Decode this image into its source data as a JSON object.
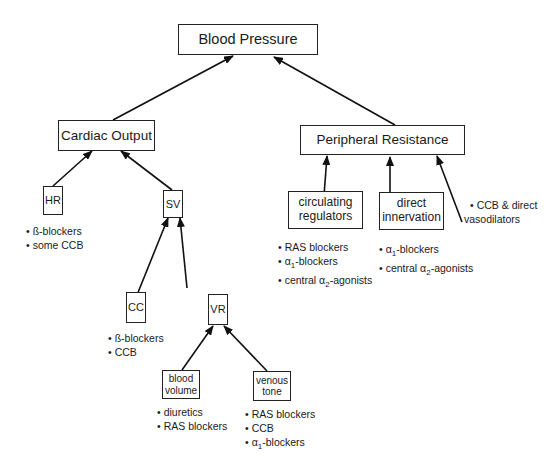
{
  "diagram": {
    "nodes": {
      "blood_pressure": "Blood Pressure",
      "cardiac_output": "Cardiac Output",
      "peripheral_resistance": "Peripheral Resistance",
      "hr": "HR",
      "sv": "SV",
      "cc": "CC",
      "vr": "VR",
      "blood_volume_1": "blood",
      "blood_volume_2": "volume",
      "venous_tone_1": "venous",
      "venous_tone_2": "tone",
      "circulating_1": "circulating",
      "circulating_2": "regulators",
      "direct_1": "direct",
      "direct_2": "innervation"
    },
    "drugs": {
      "hr": [
        "ß-blockers",
        "some CCB"
      ],
      "cc": [
        "ß-blockers",
        "CCB"
      ],
      "blood_volume": [
        "diuretics",
        "RAS blockers"
      ],
      "venous_tone": [
        "RAS blockers",
        "CCB",
        "α1-blockers"
      ],
      "circulating": [
        "RAS blockers",
        "α1-blockers",
        "central α2-agonists"
      ],
      "direct": [
        "α1-blockers",
        "central α2-agonists"
      ],
      "vasodilators": [
        "CCB & direct",
        "vasodilators"
      ]
    },
    "edges": [
      [
        "Cardiac Output",
        "Blood Pressure"
      ],
      [
        "Peripheral Resistance",
        "Blood Pressure"
      ],
      [
        "HR",
        "Cardiac Output"
      ],
      [
        "SV",
        "Cardiac Output"
      ],
      [
        "CC",
        "SV"
      ],
      [
        "VR",
        "SV"
      ],
      [
        "blood volume",
        "VR"
      ],
      [
        "venous tone",
        "VR"
      ],
      [
        "circulating regulators",
        "Peripheral Resistance"
      ],
      [
        "direct innervation",
        "Peripheral Resistance"
      ],
      [
        "CCB & direct vasodilators",
        "Peripheral Resistance"
      ]
    ]
  }
}
